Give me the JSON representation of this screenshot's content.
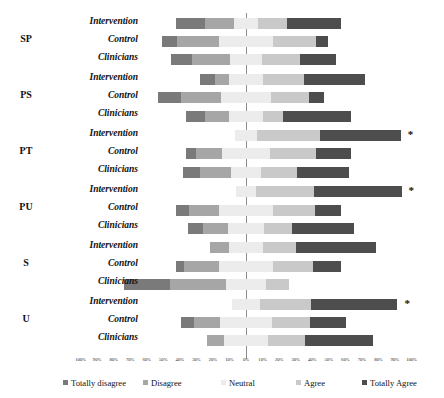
{
  "chart_data": {
    "type": "bar",
    "subtype": "diverging-stacked-likert",
    "title": "",
    "xlabel": "",
    "ylabel": "",
    "grid": false,
    "legend_position": "bottom",
    "xlim": [
      -100,
      100
    ],
    "zero_percent_label": "0%",
    "axis_ticks": [
      "100%",
      "90%",
      "80%",
      "70%",
      "60%",
      "50%",
      "40%",
      "30%",
      "20%",
      "10%",
      "0%",
      "10%",
      "20%",
      "30%",
      "40%",
      "50%",
      "60%",
      "70%",
      "80%",
      "90%",
      "100%"
    ],
    "axis_tick_values": [
      -100,
      -90,
      -80,
      -70,
      -60,
      -50,
      -40,
      -30,
      -20,
      -10,
      0,
      10,
      20,
      30,
      40,
      50,
      60,
      70,
      80,
      90,
      100
    ],
    "categories": [
      "Totally disagree",
      "Disagree",
      "Neutral",
      "Agree",
      "Totally Agree"
    ],
    "colors": {
      "totally_disagree": "#7a7a7a",
      "disagree": "#a6a6a6",
      "neutral": "#ececec",
      "agree": "#c9c9c9",
      "totally_agree": "#4d4d4d",
      "zero_line": "#8c8c8c",
      "text": "#111111"
    },
    "significance_marker": "*",
    "groups": [
      {
        "name": "SP",
        "rows": [
          {
            "label": "Intervention",
            "values": [
              18,
              17,
              15,
              17,
              33
            ],
            "significant": false
          },
          {
            "label": "Control",
            "values": [
              9,
              25,
              33,
              26,
              7
            ],
            "significant": false
          },
          {
            "label": "Clinicians",
            "values": [
              13,
              23,
              19,
              23,
              22
            ],
            "significant": false
          }
        ]
      },
      {
        "name": "PS",
        "rows": [
          {
            "label": "Intervention",
            "values": [
              9,
              9,
              20,
              25,
              37
            ],
            "significant": false
          },
          {
            "label": "Control",
            "values": [
              14,
              24,
              30,
              23,
              9
            ],
            "significant": false
          },
          {
            "label": "Clinicians",
            "values": [
              12,
              14,
              21,
              12,
              41
            ],
            "significant": false
          }
        ]
      },
      {
        "name": "PT",
        "rows": [
          {
            "label": "Intervention",
            "values": [
              0,
              0,
              13,
              38,
              49
            ],
            "significant": true
          },
          {
            "label": "Control",
            "values": [
              6,
              16,
              29,
              28,
              21
            ],
            "significant": false
          },
          {
            "label": "Clinicians",
            "values": [
              10,
              19,
              18,
              22,
              31
            ],
            "significant": false
          }
        ]
      },
      {
        "name": "PU",
        "rows": [
          {
            "label": "Intervention",
            "values": [
              0,
              0,
              12,
              35,
              53
            ],
            "significant": true
          },
          {
            "label": "Control",
            "values": [
              8,
              18,
              33,
              25,
              16
            ],
            "significant": false
          },
          {
            "label": "Clinicians",
            "values": [
              9,
              15,
              22,
              17,
              37
            ],
            "significant": false
          }
        ]
      },
      {
        "name": "S",
        "rows": [
          {
            "label": "Intervention",
            "values": [
              0,
              11,
              21,
              20,
              48
            ],
            "significant": false
          },
          {
            "label": "Control",
            "values": [
              5,
              21,
              33,
              24,
              17
            ],
            "significant": false
          },
          {
            "label": "Clinicians",
            "values": [
              28,
              34,
              24,
              14,
              0
            ],
            "significant": false
          }
        ]
      },
      {
        "name": "U",
        "rows": [
          {
            "label": "Intervention",
            "values": [
              0,
              0,
              17,
              31,
              52
            ],
            "significant": true
          },
          {
            "label": "Control",
            "values": [
              8,
              16,
              31,
              23,
              22
            ],
            "significant": false
          },
          {
            "label": "Clinicians",
            "values": [
              0,
              10,
              27,
              22,
              41
            ],
            "significant": false
          }
        ]
      }
    ],
    "legend": [
      {
        "label": "Totally disagree",
        "color": "#7a7a7a"
      },
      {
        "label": "Disagree",
        "color": "#a6a6a6"
      },
      {
        "label": "Neutral",
        "color": "#ececec"
      },
      {
        "label": "Agree",
        "color": "#c9c9c9"
      },
      {
        "label": "Totally Agree",
        "color": "#4d4d4d"
      }
    ]
  }
}
